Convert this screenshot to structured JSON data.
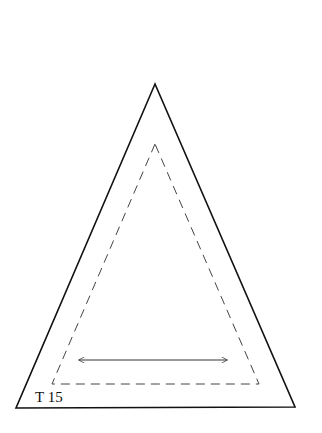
{
  "pattern": {
    "label": "T 15",
    "shape": "triangle",
    "outer_outline": {
      "style": "solid",
      "color": "#111111"
    },
    "seam_line": {
      "style": "dashed",
      "color": "#333333"
    },
    "grain_arrow": {
      "direction": "horizontal",
      "heads": "both"
    }
  }
}
